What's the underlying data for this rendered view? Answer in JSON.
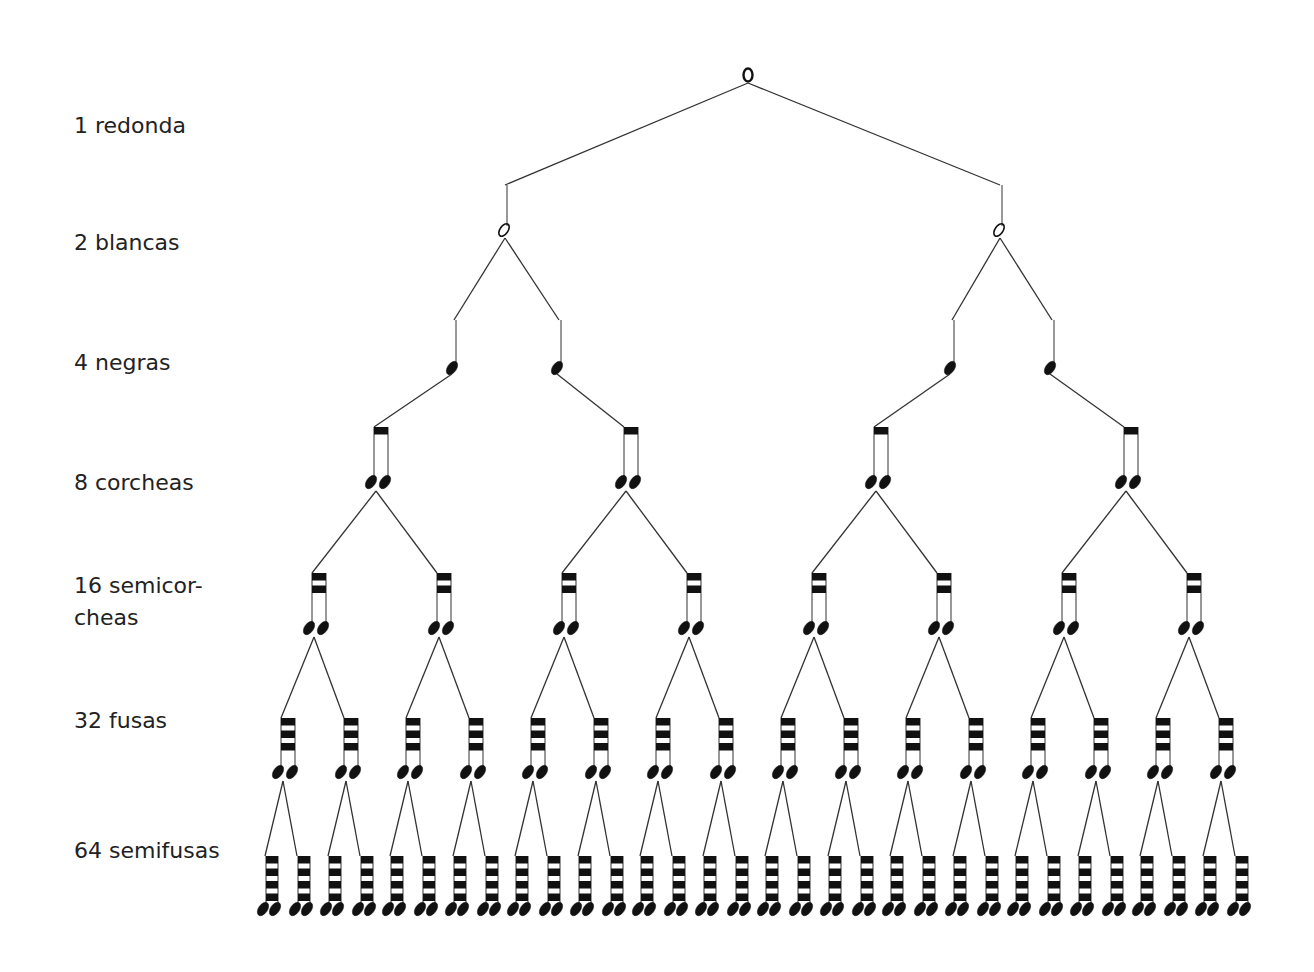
{
  "diagram": {
    "levels": [
      {
        "count": 1,
        "name": "redonda",
        "label": "1 redonda",
        "y": 110
      },
      {
        "count": 2,
        "name": "blancas",
        "label": "2 blancas",
        "y": 227
      },
      {
        "count": 4,
        "name": "negras",
        "label": "4 negras",
        "y": 347
      },
      {
        "count": 8,
        "name": "corcheas",
        "label": "8 corcheas",
        "y": 467
      },
      {
        "count": 16,
        "name": "semicorcheas",
        "label": "16 semicor-\ncheas",
        "y": 570
      },
      {
        "count": 32,
        "name": "fusas",
        "label": "32 fusas",
        "y": 705
      },
      {
        "count": 64,
        "name": "semifusas",
        "label": "64 semifusas",
        "y": 835
      }
    ],
    "colors": {
      "ink": "#111111",
      "text": "#222222",
      "background": "#ffffff"
    }
  }
}
